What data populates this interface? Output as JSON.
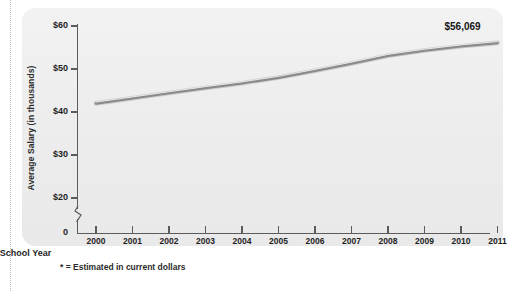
{
  "chart_data": {
    "type": "line",
    "title": "",
    "xlabel": "School Year",
    "ylabel": "Average Salary (in thousands)",
    "x": [
      2000,
      2001,
      2002,
      2003,
      2004,
      2005,
      2006,
      2007,
      2008,
      2009,
      2010,
      2011
    ],
    "xtick_labels": [
      "2000",
      "2001",
      "2002",
      "2003",
      "2004",
      "2005",
      "2006",
      "2007",
      "2008",
      "2009",
      "2010",
      "2011"
    ],
    "values": [
      42.0,
      43.2,
      44.4,
      45.6,
      46.7,
      48.0,
      49.6,
      51.3,
      53.1,
      54.3,
      55.3,
      56.069
    ],
    "ytick_values": [
      20,
      30,
      40,
      50,
      60
    ],
    "ytick_labels": [
      "$20",
      "$30",
      "$40",
      "$50",
      "$60"
    ],
    "zero_tick_label": "0",
    "ylim": [
      18,
      62
    ],
    "axis_break": true,
    "grid": false,
    "legend": "none",
    "series_color": "#8a8a8a",
    "series_highlight_color": "#c9c9c9",
    "annotations": [
      {
        "name": "endpoint-value",
        "text": "$56,069",
        "x": 2011,
        "y": 56.069
      }
    ]
  },
  "footnote": {
    "text": "* = Estimated in current dollars"
  },
  "panel": {
    "background_color": "#f0f0f0",
    "axis_color": "#5b5b5b"
  }
}
